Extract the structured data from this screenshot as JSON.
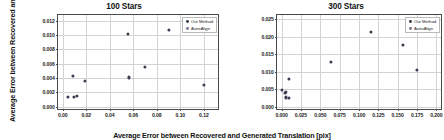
{
  "figure": {
    "xlabel": "Average Error between Recovered and Generated Translation [pix]",
    "ylabel": "Average Error between Recovered and Generated Translation [deg]"
  },
  "legend": {
    "series": [
      {
        "name": "Our Method",
        "color": "#3b3b4f"
      },
      {
        "name": "AstroAlign",
        "color": "#7b7b8c"
      }
    ]
  },
  "chart_data": [
    {
      "type": "scatter",
      "title": "100 Stars",
      "xlabel": "Average Error between Recovered and Generated Translation [pix]",
      "ylabel": "Average Error between Recovered and Generated Translation [deg]",
      "xlim": [
        -0.004,
        0.132
      ],
      "ylim": [
        -0.0003,
        0.0128
      ],
      "xticks": [
        "0.00",
        "0.02",
        "0.04",
        "0.06",
        "0.08",
        "0.10",
        "0.12"
      ],
      "xtick_values": [
        0.0,
        0.02,
        0.04,
        0.06,
        0.08,
        0.1,
        0.12
      ],
      "yticks": [
        "0.000",
        "0.002",
        "0.004",
        "0.006",
        "0.008",
        "0.010",
        "0.012"
      ],
      "ytick_values": [
        0.0,
        0.002,
        0.004,
        0.006,
        0.008,
        0.01,
        0.012
      ],
      "grid": true,
      "legend_position": "upper-right",
      "series": [
        {
          "name": "Our Method",
          "color": "#3b3b4f",
          "points": [
            {
              "x": 0.0042,
              "y": 0.00143
            },
            {
              "x": 0.0098,
              "y": 0.00133
            },
            {
              "x": 0.0122,
              "y": 0.00148
            },
            {
              "x": 0.0088,
              "y": 0.00432
            },
            {
              "x": 0.0188,
              "y": 0.00365
            },
            {
              "x": 0.0558,
              "y": 0.0101
            },
            {
              "x": 0.0565,
              "y": 0.0041
            },
            {
              "x": 0.07,
              "y": 0.00555
            },
            {
              "x": 0.09,
              "y": 0.0107
            },
            {
              "x": 0.12,
              "y": 0.0031
            }
          ]
        }
      ]
    },
    {
      "type": "scatter",
      "title": "300 Stars",
      "xlabel": "Average Error between Recovered and Generated Translation [pix]",
      "ylabel": "Average Error between Recovered and Generated Translation [deg]",
      "xlim": [
        -0.006,
        0.206
      ],
      "ylim": [
        -0.0006,
        0.0262
      ],
      "xticks": [
        "0.000",
        "0.025",
        "0.050",
        "0.075",
        "0.100",
        "0.125",
        "0.150",
        "0.175",
        "0.200"
      ],
      "xtick_values": [
        0.0,
        0.025,
        0.05,
        0.075,
        0.1,
        0.125,
        0.15,
        0.175,
        0.2
      ],
      "yticks": [
        "0.000",
        "0.005",
        "0.010",
        "0.015",
        "0.020",
        "0.025"
      ],
      "ytick_values": [
        0.0,
        0.005,
        0.01,
        0.015,
        0.02,
        0.025
      ],
      "grid": true,
      "legend_position": "upper-right",
      "series": [
        {
          "name": "Our Method",
          "color": "#3b3b4f",
          "points": [
            {
              "x": 0.0005,
              "y": 0.0049
            },
            {
              "x": 0.0048,
              "y": 0.004
            },
            {
              "x": 0.006,
              "y": 0.00425
            },
            {
              "x": 0.0052,
              "y": 0.0027
            },
            {
              "x": 0.009,
              "y": 0.00245
            },
            {
              "x": 0.0095,
              "y": 0.00785
            },
            {
              "x": 0.064,
              "y": 0.0127
            },
            {
              "x": 0.115,
              "y": 0.0213
            },
            {
              "x": 0.157,
              "y": 0.0176
            },
            {
              "x": 0.175,
              "y": 0.0106
            }
          ]
        }
      ]
    }
  ]
}
